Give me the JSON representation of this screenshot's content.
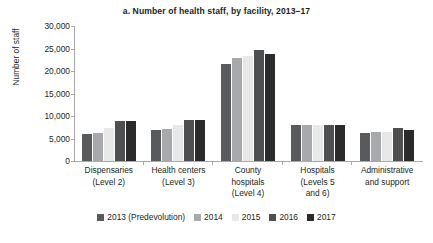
{
  "chart_data": {
    "type": "bar",
    "title": "a. Number of health staff, by facility, 2013–17",
    "xlabel": "",
    "ylabel": "Number of staff",
    "ylim": [
      0,
      30000
    ],
    "yticks": [
      "0",
      "5,000",
      "10,000",
      "15,000",
      "20,000",
      "25,000",
      "30,000"
    ],
    "ytick_values": [
      0,
      5000,
      10000,
      15000,
      20000,
      25000,
      30000
    ],
    "grid": false,
    "legend_position": "bottom",
    "categories": [
      "Dispensaries\n(Level 2)",
      "Health centers\n(Level 3)",
      "County\nhospitals\n(Level 4)",
      "Hospitals\n(Levels 5\nand 6)",
      "Administrative\nand support"
    ],
    "category_lines": [
      [
        "Dispensaries",
        "(Level 2)"
      ],
      [
        "Health centers",
        "(Level 3)"
      ],
      [
        "County",
        "hospitals",
        "(Level 4)"
      ],
      [
        "Hospitals",
        "(Levels 5",
        "and 6)"
      ],
      [
        "Administrative",
        "and support"
      ]
    ],
    "series": [
      {
        "name": "2013 (Predevolution)",
        "color": "#595a5c",
        "values": [
          5900,
          6800,
          21600,
          7900,
          6300
        ]
      },
      {
        "name": "2014",
        "color": "#a7a9ac",
        "values": [
          6200,
          7200,
          22900,
          8000,
          6400
        ]
      },
      {
        "name": "2015",
        "color": "#e8e8e8",
        "values": [
          7400,
          8100,
          23400,
          8100,
          6500
        ]
      },
      {
        "name": "2016",
        "color": "#4e4f51",
        "values": [
          8800,
          9100,
          24600,
          8100,
          7300
        ]
      },
      {
        "name": "2017",
        "color": "#2b2b2b",
        "values": [
          8800,
          9100,
          23700,
          7900,
          6800
        ]
      }
    ]
  }
}
